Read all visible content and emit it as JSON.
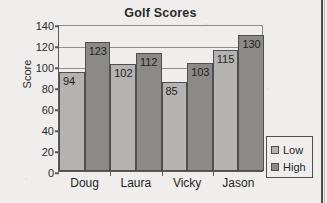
{
  "chart_data": {
    "type": "bar",
    "title": "Golf Scores",
    "xlabel": "",
    "ylabel": "Score",
    "categories": [
      "Doug",
      "Laura",
      "Vicky",
      "Jason"
    ],
    "series": [
      {
        "name": "Low",
        "values": [
          94,
          102,
          85,
          115
        ],
        "color": "#b4b3b1"
      },
      {
        "name": "High",
        "values": [
          123,
          112,
          103,
          130
        ],
        "color": "#8b8a88"
      }
    ],
    "ylim": [
      0,
      140
    ],
    "yticks": [
      0,
      20,
      40,
      60,
      80,
      100,
      120,
      140
    ],
    "grid": "horizontal",
    "data_labels": true,
    "legend_position": "right"
  },
  "legend": {
    "items": [
      {
        "label": "Low",
        "swatch": "low-swatch"
      },
      {
        "label": "High",
        "swatch": "high-swatch"
      }
    ]
  }
}
